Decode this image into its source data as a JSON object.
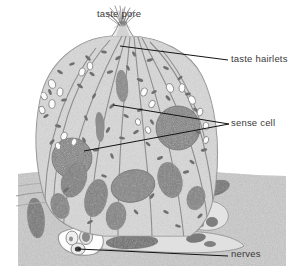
{
  "figure": {
    "type": "histological-illustration",
    "style": "grayscale stippled line drawing",
    "colors": {
      "background": "#ffffff",
      "cytoplasm": "#d8d8d8",
      "cytoplasm_light": "#e6e6e6",
      "nucleus": "#8f8f8f",
      "granule": "#6e6e6e",
      "outline": "#8a8a8a",
      "leader_line": "#1a1a1a",
      "label_text": "#3a3a3a",
      "epithelium": "#cfcfcf"
    }
  },
  "labels": [
    {
      "id": "taste-pore",
      "text": "taste pore",
      "position": "top-center",
      "leader": "none-visible"
    },
    {
      "id": "taste-hairlets",
      "text": "taste hairlets",
      "position": "right-upper",
      "leader": "single line to pore apex"
    },
    {
      "id": "sense-cell",
      "text": "sense cell",
      "position": "right-middle",
      "leader": "two lines, converging arrowhead"
    },
    {
      "id": "nerves",
      "text": "nerves",
      "position": "right-bottom",
      "leader": "single line to nerve bundle"
    }
  ],
  "structures": [
    {
      "name": "taste pore",
      "description": "opening at apex of taste bud"
    },
    {
      "name": "taste hairlets",
      "description": "microvilli projecting through the pore"
    },
    {
      "name": "sense cell",
      "description": "elongated sensory receptor cell with large nucleus"
    },
    {
      "name": "supporting cell",
      "description": "elongated cells surrounding sense cells"
    },
    {
      "name": "nerves",
      "description": "nerve fibre bundle at base of taste bud"
    },
    {
      "name": "epithelium",
      "description": "surrounding stratified tissue at the base"
    }
  ]
}
